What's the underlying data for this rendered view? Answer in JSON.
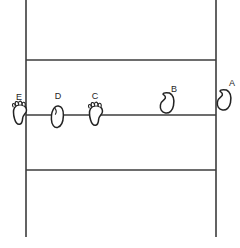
{
  "figure": {
    "kind": "court-position-diagram",
    "background_color": "#ffffff",
    "line_color": "#3c3c3c",
    "footprint_stroke_color": "#232323",
    "label_color": "#1e1e1e"
  },
  "court": {
    "left_sideline_x": 26,
    "right_sideline_x": 216,
    "top_y": 0,
    "bottom_y": 237,
    "horizontal_lines_y": [
      60,
      115,
      170
    ],
    "vertical_lines_x": [
      26,
      216
    ]
  },
  "markers": [
    {
      "id": "A",
      "label": "A",
      "x": 222,
      "y": 100,
      "label_x": 232,
      "label_y": 86,
      "foot": "right",
      "toes": false,
      "region": "outside-right-sideline"
    },
    {
      "id": "B",
      "label": "B",
      "x": 165,
      "y": 103,
      "label_x": 174,
      "label_y": 92,
      "foot": "right",
      "toes": false,
      "region": "above-center-line"
    },
    {
      "id": "C",
      "label": "C",
      "x": 96,
      "y": 115,
      "label_x": 95,
      "label_y": 99,
      "foot": "left",
      "toes": true,
      "region": "on-center-line"
    },
    {
      "id": "D",
      "label": "D",
      "x": 57,
      "y": 117,
      "label_x": 58,
      "label_y": 99,
      "foot": "right",
      "toes": false,
      "region": "on-center-line"
    },
    {
      "id": "E",
      "label": "E",
      "x": 20,
      "y": 114,
      "label_x": 19,
      "label_y": 100,
      "foot": "left",
      "toes": true,
      "region": "on-left-sideline"
    }
  ]
}
